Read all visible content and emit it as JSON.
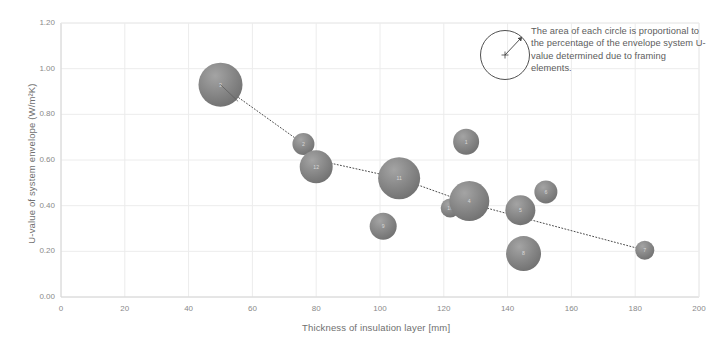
{
  "chart_data": {
    "type": "scatter",
    "title": "",
    "xlabel": "Thickness of insulation layer [mm]",
    "ylabel": "U-value of system envelope (W/m²K)",
    "xlim": [
      0,
      200
    ],
    "ylim": [
      0.0,
      1.2
    ],
    "xticks": [
      "0",
      "20",
      "40",
      "60",
      "80",
      "100",
      "120",
      "140",
      "160",
      "180",
      "200"
    ],
    "yticks": [
      "0.00",
      "0.20",
      "0.40",
      "0.60",
      "0.80",
      "1.00",
      "1.20"
    ],
    "grid": true,
    "legend_position": "top-right",
    "bubble_meaning": "The area of each circle is proportional to the percentage of the envelope system U-value determined due to framing elements.",
    "points": [
      {
        "label": "3",
        "x": 50,
        "y": 0.93,
        "size": 22.0
      },
      {
        "label": "2",
        "x": 76,
        "y": 0.67,
        "size": 11.0
      },
      {
        "label": "12",
        "x": 80,
        "y": 0.57,
        "size": 16.5
      },
      {
        "label": "9",
        "x": 101,
        "y": 0.31,
        "size": 13.5
      },
      {
        "label": "11",
        "x": 106,
        "y": 0.52,
        "size": 21.0
      },
      {
        "label": "10",
        "x": 122,
        "y": 0.39,
        "size": 9.5
      },
      {
        "label": "1",
        "x": 127,
        "y": 0.68,
        "size": 13.0
      },
      {
        "label": "4",
        "x": 128,
        "y": 0.42,
        "size": 20.0
      },
      {
        "label": "5",
        "x": 144,
        "y": 0.38,
        "size": 15.0
      },
      {
        "label": "8",
        "x": 145,
        "y": 0.19,
        "size": 17.5
      },
      {
        "label": "6",
        "x": 152,
        "y": 0.46,
        "size": 11.5
      },
      {
        "label": "7",
        "x": 183,
        "y": 0.205,
        "size": 9.5
      }
    ],
    "trend_line": {
      "style": "dotted",
      "color": "#4a4a4a",
      "path_x": [
        50,
        76,
        80,
        106,
        128,
        144,
        183
      ],
      "path_y": [
        0.93,
        0.67,
        0.6,
        0.52,
        0.41,
        0.35,
        0.205
      ]
    },
    "colors": {
      "bubble_fill": "#7a7a7a",
      "bubble_highlight": "#a6a6a6",
      "grid": "#ececec",
      "axis_text": "#8a8a8a",
      "note_text": "#5d5d5d"
    }
  },
  "legend": {
    "note_text": "The area of each circle is proportional to the percentage of the envelope system U-value determined due to framing elements.",
    "circle_name": "legend-radius-circle"
  }
}
